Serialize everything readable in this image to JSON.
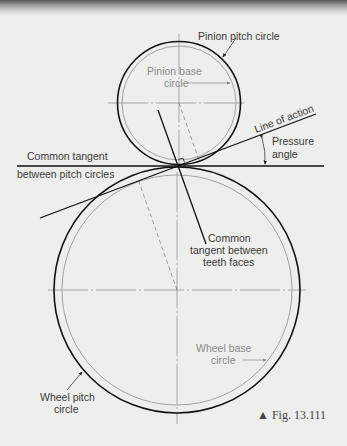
{
  "figure": {
    "caption": "▲ Fig. 13.111",
    "labels": {
      "pinion_pitch_circle": "Pinion pitch circle",
      "pinion_base_circle_line1": "Pinion base",
      "pinion_base_circle_line2": "circle",
      "line_of_action": "Line of action",
      "pressure_angle_line1": "Pressure",
      "pressure_angle_line2": "angle",
      "common_tangent_line1": "Common tangent",
      "common_tangent_line2": "between pitch circles",
      "teeth_tangent_line1": "Common",
      "teeth_tangent_line2": "tangent between",
      "teeth_tangent_line3": "teeth faces",
      "wheel_base_circle_line1": "Wheel base",
      "wheel_base_circle_line2": "circle",
      "wheel_pitch_circle_line1": "Wheel pitch",
      "wheel_pitch_circle_line2": "circle"
    },
    "colors": {
      "outline": "#111111",
      "base_circle": "#9a9a9a",
      "centerline": "#777777",
      "background": "#eeeeec"
    }
  }
}
